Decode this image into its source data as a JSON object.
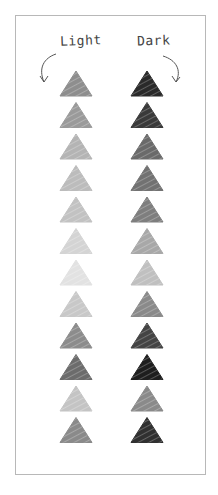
{
  "labels": {
    "light": "Light",
    "dark": "Dark"
  },
  "columns": [
    {
      "name": "light",
      "shades": [
        "#8e8e8e",
        "#9a9a9a",
        "#b4b4b4",
        "#bcbcbc",
        "#c2c2c2",
        "#d4d4d4",
        "#e2e2e2",
        "#c8c8c8",
        "#8c8c8c",
        "#6c6c6c",
        "#c4c4c4",
        "#8a8a8a"
      ]
    },
    {
      "name": "dark",
      "shades": [
        "#2a2a2a",
        "#3a3a3a",
        "#6a6a6a",
        "#727272",
        "#7e7e7e",
        "#a8a8a8",
        "#c0c0c0",
        "#8a8a8a",
        "#444444",
        "#1e1e1e",
        "#8a8a8a",
        "#303030"
      ]
    }
  ],
  "icons": {
    "light_arrow": "curved-arrow-down-left",
    "dark_arrow": "curved-arrow-down-right",
    "shape": "sketched-triangle"
  }
}
